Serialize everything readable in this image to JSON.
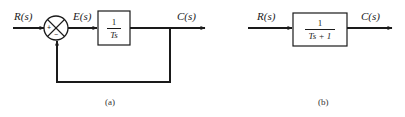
{
  "diagram_a": {
    "caption": "(a)",
    "input_label": "R(s)",
    "error_label": "E(s)",
    "output_label": "C(s)",
    "summing_junction": {
      "plus_sign": "+",
      "minus_sign": "−"
    },
    "block": {
      "numerator": "1",
      "denominator": "Ts"
    },
    "feedback": "unity negative feedback"
  },
  "diagram_b": {
    "caption": "(b)",
    "input_label": "R(s)",
    "output_label": "C(s)",
    "block": {
      "numerator": "1",
      "denominator": "Ts + 1"
    }
  },
  "colors": {
    "line": "#1a1a1a",
    "background": "#ffffff"
  }
}
